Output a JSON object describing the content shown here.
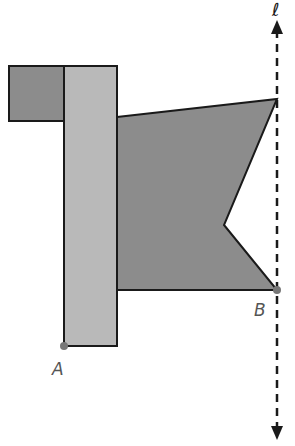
{
  "diagram": {
    "colors": {
      "dark_fill": "#8c8c8c",
      "light_fill": "#b9b9b9",
      "stroke": "#1a1a1a",
      "point": "#777777",
      "label": "#555555"
    },
    "line": {
      "label": "ℓ",
      "x": 277,
      "y1": 20,
      "y2": 438,
      "style": "dashed",
      "arrows": "both"
    },
    "points": [
      {
        "label": "A",
        "x": 64,
        "y": 346,
        "label_x": 52,
        "label_y": 375
      },
      {
        "label": "B",
        "x": 277,
        "y": 290,
        "label_x": 254,
        "label_y": 316
      }
    ],
    "shapes": {
      "square": {
        "x": 9,
        "y": 66,
        "w": 55,
        "h": 55
      },
      "tall_rect": {
        "x": 64,
        "y": 66,
        "w": 53,
        "h": 280
      },
      "pentagon": "117,117 277,99 224,225 277,290 117,290"
    }
  }
}
